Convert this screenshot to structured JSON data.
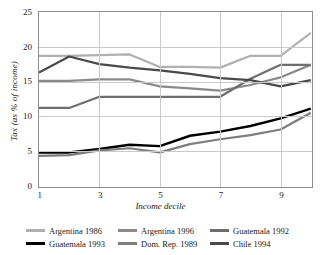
{
  "chart_data": {
    "type": "line",
    "title": "",
    "xlabel": "Income decile",
    "ylabel": "Tax (as % of income)",
    "x": [
      1,
      2,
      3,
      4,
      5,
      6,
      7,
      8,
      9,
      10
    ],
    "xlim": [
      1,
      10
    ],
    "ylim": [
      0,
      25
    ],
    "xticks": [
      1,
      3,
      5,
      7,
      9
    ],
    "yticks": [
      0,
      5,
      10,
      15,
      20,
      25
    ],
    "grid": true,
    "legend_position": "bottom",
    "series": [
      {
        "name": "Argentina 1986",
        "color": "#b0b0b0",
        "width": 2.2,
        "values": [
          18.7,
          18.7,
          18.8,
          18.9,
          17.1,
          17.1,
          17.0,
          18.7,
          18.7,
          22.0
        ]
      },
      {
        "name": "Argentina 1996",
        "color": "#8a8a8a",
        "width": 2.2,
        "values": [
          15.1,
          15.1,
          15.3,
          15.3,
          14.3,
          14.0,
          13.7,
          14.5,
          15.6,
          17.4
        ]
      },
      {
        "name": "Guatemala 1992",
        "color": "#6e6e6e",
        "width": 2.2,
        "values": [
          11.2,
          11.2,
          12.8,
          12.8,
          12.8,
          12.8,
          12.8,
          15.4,
          17.4,
          17.4
        ]
      },
      {
        "name": "Guatemala 1993",
        "color": "#000000",
        "width": 2.4,
        "values": [
          4.8,
          4.8,
          5.3,
          5.9,
          5.7,
          7.2,
          7.8,
          8.6,
          9.7,
          11.1
        ]
      },
      {
        "name": "Dom. Rep. 1989",
        "color": "#7d7d7d",
        "width": 2.2,
        "values": [
          4.3,
          4.4,
          5.1,
          5.4,
          4.8,
          6.0,
          6.7,
          7.3,
          8.1,
          10.5
        ]
      },
      {
        "name": "Chile 1994",
        "color": "#4a4a4a",
        "width": 2.2,
        "values": [
          16.3,
          18.6,
          17.5,
          17.0,
          16.6,
          16.1,
          15.5,
          15.2,
          14.3,
          15.2
        ]
      }
    ]
  },
  "legend": {
    "items": [
      {
        "label": "Argentina 1986"
      },
      {
        "label": "Argentina 1996"
      },
      {
        "label": "Guatemala 1992"
      },
      {
        "label": "Guatemala 1993"
      },
      {
        "label": "Dom. Rep. 1989"
      },
      {
        "label": "Chile 1994"
      }
    ]
  }
}
